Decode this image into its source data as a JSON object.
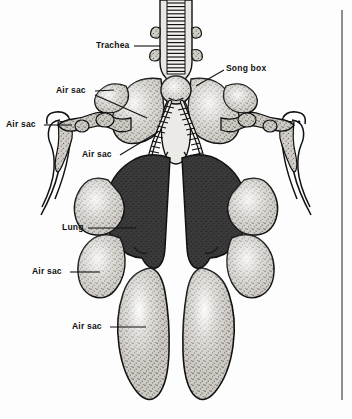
{
  "figure": {
    "background_color": "#fdfdfd",
    "ink_color": "#111111",
    "lung_color": "#3a3a3a",
    "air_sac_color": "#c9c6c0",
    "rule_color": "#8e8e8e"
  },
  "labels": [
    {
      "id": "trachea",
      "text": "Trachea"
    },
    {
      "id": "song-box",
      "text": "Song box"
    },
    {
      "id": "air-sac-1",
      "text": "Air sac"
    },
    {
      "id": "air-sac-2",
      "text": "Air sac"
    },
    {
      "id": "air-sac-3",
      "text": "Air sac"
    },
    {
      "id": "lung",
      "text": "Lung"
    },
    {
      "id": "air-sac-4",
      "text": "Air sac"
    },
    {
      "id": "air-sac-5",
      "text": "Air sac"
    }
  ]
}
